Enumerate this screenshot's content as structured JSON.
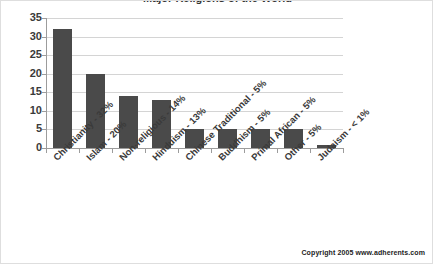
{
  "chart_data": {
    "type": "bar",
    "title": "Major Religions of the World",
    "xlabel": "",
    "ylabel": "",
    "ylim": [
      0,
      35
    ],
    "ytick_step": 5,
    "yticks": [
      35,
      30,
      25,
      20,
      15,
      10,
      5,
      0
    ],
    "grid": true,
    "legend": null,
    "categories": [
      "Christianity - 32%",
      "Islam - 20%",
      "Non-religious - 14%",
      "Hinduism - 13%",
      "Chinese Traditional - 5%",
      "Buddhism - 5%",
      "Primal African - 5%",
      "Other - 5%",
      "Judaism - < 1%"
    ],
    "values": [
      32,
      20,
      14,
      13,
      5,
      5,
      5,
      5,
      0.8
    ],
    "bar_color": "#4a4a4a",
    "gridline_color": "#d4d4d4",
    "axis_color": "#9c9c9c",
    "background_color": "#ffffff"
  },
  "footer": {
    "copyright": "Copyright 2005 www.adherents.com"
  }
}
